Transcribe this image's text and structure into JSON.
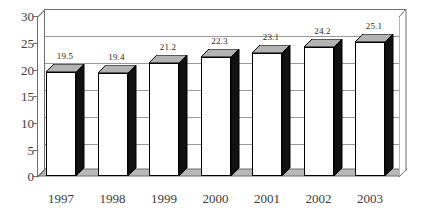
{
  "chart_data": {
    "type": "bar",
    "title": "",
    "subtitle": "",
    "xlabel": "",
    "ylabel": "",
    "categories": [
      "1997",
      "1998",
      "1999",
      "2000",
      "2001",
      "2002",
      "2003"
    ],
    "values": [
      19.5,
      19.4,
      21.2,
      22.3,
      23.1,
      24.2,
      25.1
    ],
    "data_labels": [
      "19.5",
      "19.4",
      "21.2",
      "22.3",
      "23.1",
      "24.2",
      "25.1"
    ],
    "ylim": [
      0,
      30
    ],
    "ytick_step": 5,
    "ytick_labels": [
      "0",
      "5",
      "10",
      "15",
      "20",
      "25",
      "30"
    ],
    "ytick_values": [
      0,
      5,
      10,
      15,
      20,
      25,
      30
    ],
    "grid": true,
    "grid_axis": "y",
    "legend": false,
    "legend_position": "none",
    "style": "3d-column",
    "colors": {
      "bar_front": "#ffffff",
      "bar_side": "#111111",
      "bar_top": "#b3b3b3",
      "bar_outline": "#000000",
      "gridline": "#9a9a9a",
      "axis": "#6f6f6f",
      "floor": "#b8b8b8",
      "side_wall": "#ffffff",
      "background": "#ffffff",
      "text": "#3d3d3d"
    }
  }
}
